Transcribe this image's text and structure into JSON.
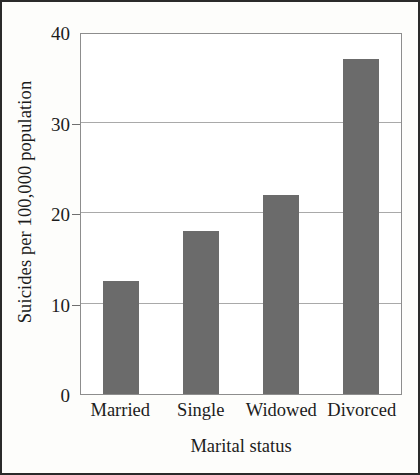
{
  "chart_data": {
    "type": "bar",
    "title": "",
    "xlabel": "Marital status",
    "ylabel": "Suicides per 100,000 population",
    "categories": [
      "Married",
      "Single",
      "Widowed",
      "Divorced"
    ],
    "values": [
      12.5,
      18,
      22,
      37
    ],
    "ylim": [
      0,
      40
    ],
    "yticks": [
      0,
      10,
      20,
      30,
      40
    ],
    "ytick_labels": [
      "0",
      "10",
      "20",
      "30",
      "40"
    ],
    "grid": "horizontal",
    "legend": "none",
    "bar_color": "#6b6b6b",
    "axis_color": "#8d8d8d",
    "gridline_color": "#a9a9a9",
    "background_color": "#ffffff"
  }
}
